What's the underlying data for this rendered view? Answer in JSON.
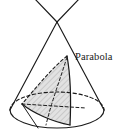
{
  "figure": {
    "name": "conic-section-parabola",
    "background_color": "#ffffff",
    "stroke_color": "#1a1a1a",
    "shade_fill_color": "#d9d9d9",
    "shade_hatch_color": "#a8a8a8"
  },
  "labels": {
    "parabola": "Parabola"
  },
  "geometry": {
    "apex": {
      "x": 57,
      "y": 22
    },
    "base_ellipse": {
      "cx": 57,
      "cy": 110,
      "rx": 47,
      "ry": 18,
      "front_style": "solid",
      "back_style": "dashed"
    },
    "cone_left_edge": {
      "x1": 57,
      "y1": 22,
      "x2": 10,
      "y2": 110
    },
    "cone_right_edge": {
      "x1": 57,
      "y1": 22,
      "x2": 104,
      "y2": 110
    },
    "upper_nappe_left": {
      "x1": 57,
      "y1": 22,
      "x2": 35,
      "y2": 0
    },
    "upper_nappe_right": {
      "x1": 57,
      "y1": 22,
      "x2": 79,
      "y2": 0
    },
    "parabola_section": {
      "apex_on_surface": {
        "x": 67,
        "y": 56
      },
      "chord_left": {
        "x": 22,
        "y": 104
      },
      "chord_right": {
        "x": 70,
        "y": 125
      },
      "axis_style": "dashed",
      "rim_front_style": "solid",
      "rim_back_style": "dashed"
    }
  }
}
